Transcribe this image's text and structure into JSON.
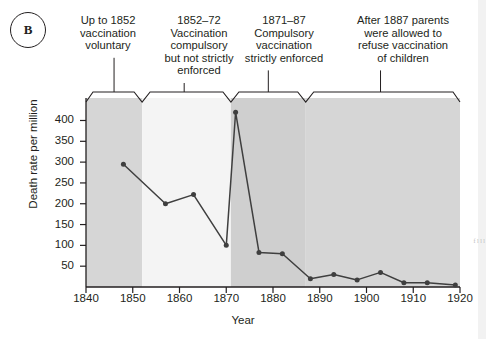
{
  "panel": {
    "letter": "B"
  },
  "annotations": [
    {
      "text": "Up to 1852\nvaccination\nvoluntary",
      "tick_year": 1846
    },
    {
      "text": "1852–72\nVaccination\ncompulsory\nbut not strictly\nenforced",
      "tick_year": 1861
    },
    {
      "text": "1871–87\nCompulsory\nvaccination\nstrictly enforced",
      "tick_year": 1879
    },
    {
      "text": "After 1887 parents\nwere allowed to\nrefuse vaccination\nof children",
      "tick_year": 1903
    }
  ],
  "bands": [
    {
      "from": 1840,
      "to": 1852,
      "shade": "#d6d6d6"
    },
    {
      "from": 1852,
      "to": 1871,
      "shade": "#f4f4f4"
    },
    {
      "from": 1871,
      "to": 1887,
      "shade": "#cfcfcf"
    },
    {
      "from": 1887,
      "to": 1920,
      "shade": "#d6d6d6"
    }
  ],
  "edge_artifact": {
    "lines": "f\nl\nl\nl"
  },
  "chart_data": {
    "type": "line",
    "title": "",
    "xlabel": "Year",
    "ylabel": "Death rate per million",
    "xlim": [
      1840,
      1920
    ],
    "ylim": [
      0,
      430
    ],
    "xticks": [
      1840,
      1850,
      1860,
      1870,
      1880,
      1890,
      1900,
      1910,
      1920
    ],
    "yticks": [
      50,
      100,
      150,
      200,
      250,
      300,
      350,
      400
    ],
    "grid": false,
    "legend": "none",
    "series": [
      {
        "name": "Smallpox death rate",
        "color": "#3f3f3f",
        "x": [
          1848,
          1857,
          1863,
          1870,
          1872,
          1877,
          1882,
          1888,
          1893,
          1898,
          1903,
          1908,
          1913,
          1919
        ],
        "values": [
          295,
          200,
          222,
          100,
          420,
          83,
          80,
          20,
          30,
          17,
          35,
          10,
          10,
          5
        ]
      }
    ]
  }
}
